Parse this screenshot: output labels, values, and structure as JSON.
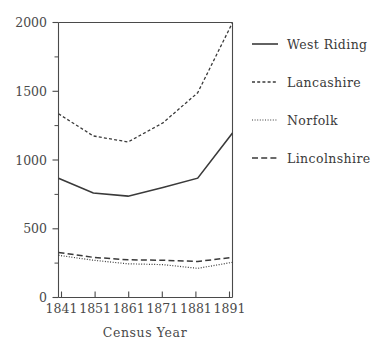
{
  "chart_data": {
    "type": "line",
    "title": "",
    "subtitle": "",
    "xlabel": "Census Year",
    "ylabel": "",
    "x": [
      1841,
      1851,
      1861,
      1871,
      1881,
      1891
    ],
    "categories": [
      "1841",
      "1851",
      "1861",
      "1871",
      "1881",
      "1891"
    ],
    "xtick_labels": [
      "1841",
      "1851",
      "1861",
      "1871",
      "1881",
      "1891"
    ],
    "ytick_labels": [
      "0",
      "500",
      "1000",
      "1500",
      "2000"
    ],
    "ytick_values": [
      0,
      500,
      1000,
      1500,
      2000
    ],
    "yminor_values": [
      250,
      750,
      1250,
      1750
    ],
    "xlim": [
      1841,
      1891
    ],
    "ylim": [
      0,
      2000
    ],
    "grid": false,
    "legend_position": "right",
    "series": [
      {
        "name": "West Riding",
        "style": "solid",
        "color": "#3a3a3a",
        "values": [
          868,
          760,
          737,
          800,
          868,
          1196
        ]
      },
      {
        "name": "Lancashire",
        "style": "dashed-short",
        "color": "#3a3a3a",
        "values": [
          1336,
          1175,
          1131,
          1270,
          1489,
          1999
        ]
      },
      {
        "name": "Norfolk",
        "style": "dotted",
        "color": "#3a3a3a",
        "values": [
          307,
          271,
          245,
          239,
          212,
          256
        ]
      },
      {
        "name": "Lincolnshire",
        "style": "dashed-long",
        "color": "#3a3a3a",
        "values": [
          328,
          292,
          274,
          271,
          262,
          292
        ]
      }
    ]
  },
  "legend": {
    "entries": [
      {
        "label": "West Riding"
      },
      {
        "label": "Lancashire"
      },
      {
        "label": "Norfolk"
      },
      {
        "label": "Lincolnshire"
      }
    ]
  },
  "axes": {
    "x_title": "Census Year"
  },
  "colors": {
    "ink": "#3a3a3a",
    "axis": "#4a4a4a",
    "background": "#ffffff"
  }
}
